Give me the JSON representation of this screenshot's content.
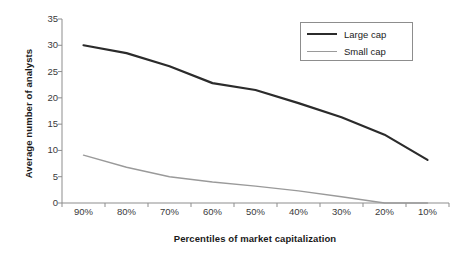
{
  "chart_data": {
    "type": "line",
    "title": "",
    "xlabel": "Percentiles of market capitalization",
    "ylabel": "Average number of analysts",
    "categories": [
      "90%",
      "80%",
      "70%",
      "60%",
      "50%",
      "40%",
      "30%",
      "20%",
      "10%"
    ],
    "ylim": [
      0,
      35
    ],
    "yticks": [
      0,
      5,
      10,
      15,
      20,
      25,
      30,
      35
    ],
    "grid": false,
    "legend_position": "top-right",
    "series": [
      {
        "name": "Large cap",
        "color": "#2b2b2b",
        "values": [
          30.0,
          28.5,
          26.0,
          22.8,
          21.5,
          19.0,
          16.3,
          13.0,
          8.2
        ]
      },
      {
        "name": "Small cap",
        "color": "#9a9a9a",
        "values": [
          9.1,
          6.8,
          5.0,
          4.0,
          3.2,
          2.3,
          1.2,
          0.0,
          0.0
        ]
      }
    ]
  },
  "legend": {
    "items": [
      {
        "label": "Large cap"
      },
      {
        "label": "Small cap"
      }
    ]
  }
}
